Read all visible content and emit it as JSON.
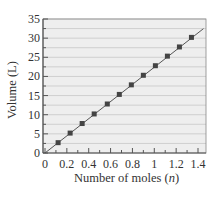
{
  "chart_data": {
    "type": "line",
    "title": "",
    "xlabel": "Number of moles (n)",
    "xlabel_parts": {
      "prefix": "Number of moles (",
      "var": "n",
      "suffix": ")"
    },
    "ylabel": "Volume (L)",
    "xlim": [
      0,
      1.45
    ],
    "ylim": [
      0,
      35
    ],
    "x_ticks": [
      0,
      0.2,
      0.4,
      0.6,
      0.8,
      1,
      1.2,
      1.4
    ],
    "x_tick_labels": [
      "0",
      "0.2",
      "0.4",
      "0.6",
      "0.8",
      "1",
      "1.2",
      "1.4"
    ],
    "x_minor_step": 0.1,
    "y_ticks": [
      0,
      5,
      10,
      15,
      20,
      25,
      30,
      35
    ],
    "y_tick_labels": [
      "0",
      "5",
      "10",
      "15",
      "20",
      "25",
      "30",
      "35"
    ],
    "y_grid_step": 2.5,
    "grid": true,
    "legend": null,
    "series": [
      {
        "name": "Volume vs moles",
        "marker": "square",
        "x": [
          0.12,
          0.23,
          0.34,
          0.45,
          0.57,
          0.68,
          0.79,
          0.9,
          1.01,
          1.12,
          1.23,
          1.34
        ],
        "y": [
          2.7,
          5.2,
          7.7,
          10.2,
          12.8,
          15.3,
          17.8,
          20.3,
          22.8,
          25.3,
          27.7,
          30.2
        ]
      }
    ],
    "fit_line": {
      "slope": 22.4,
      "intercept": 0,
      "x_range": [
        0,
        1.45
      ]
    }
  },
  "colors": {
    "plot_background": "#eeeeee",
    "grid_line": "#cfcfcf",
    "axis": "#555555",
    "line": "#555555",
    "marker": "#444444"
  }
}
